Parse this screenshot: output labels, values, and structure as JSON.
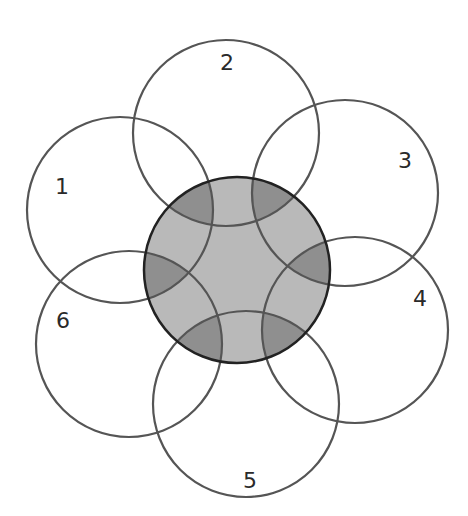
{
  "diagram": {
    "type": "venn-flower",
    "center_circle": {
      "cx": 237,
      "cy": 270,
      "r": 93,
      "fill": "#b9b9b9",
      "stroke": "#222222"
    },
    "overlap_fill": "#8f8f8f",
    "stroke_color": "#555555",
    "circles": [
      {
        "id": "1",
        "label": "1",
        "cx": 120,
        "cy": 210,
        "r": 93,
        "label_x": 62,
        "label_y": 194
      },
      {
        "id": "2",
        "label": "2",
        "cx": 226,
        "cy": 133,
        "r": 93,
        "label_x": 227,
        "label_y": 70
      },
      {
        "id": "3",
        "label": "3",
        "cx": 345,
        "cy": 193,
        "r": 93,
        "label_x": 405,
        "label_y": 168
      },
      {
        "id": "4",
        "label": "4",
        "cx": 355,
        "cy": 330,
        "r": 93,
        "label_x": 420,
        "label_y": 306
      },
      {
        "id": "5",
        "label": "5",
        "cx": 246,
        "cy": 404,
        "r": 93,
        "label_x": 250,
        "label_y": 488
      },
      {
        "id": "6",
        "label": "6",
        "cx": 129,
        "cy": 344,
        "r": 93,
        "label_x": 63,
        "label_y": 328
      }
    ]
  }
}
